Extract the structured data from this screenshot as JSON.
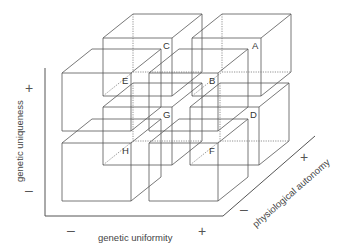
{
  "diagram": {
    "title": "",
    "cube": {
      "width": 69,
      "height": 58,
      "depth_dx": 30,
      "depth_dy": -24
    },
    "cubes": [
      {
        "label": "C",
        "x": 103,
        "y": 38,
        "layer": "back",
        "row": "top",
        "col": "left"
      },
      {
        "label": "A",
        "x": 192,
        "y": 38,
        "layer": "back",
        "row": "top",
        "col": "right"
      },
      {
        "label": "G",
        "x": 103,
        "y": 107,
        "layer": "back",
        "row": "bottom",
        "col": "left"
      },
      {
        "label": "D",
        "x": 190,
        "y": 107,
        "layer": "back",
        "row": "bottom",
        "col": "right"
      },
      {
        "label": "E",
        "x": 62,
        "y": 73,
        "layer": "front",
        "row": "top",
        "col": "left"
      },
      {
        "label": "B",
        "x": 149,
        "y": 73,
        "layer": "front",
        "row": "top",
        "col": "right"
      },
      {
        "label": "H",
        "x": 62,
        "y": 143,
        "layer": "front",
        "row": "bottom",
        "col": "left"
      },
      {
        "label": "F",
        "x": 149,
        "y": 143,
        "layer": "front",
        "row": "bottom",
        "col": "right"
      }
    ],
    "axes": {
      "vertical": {
        "label": "genetic uniqueness",
        "plus": "+",
        "minus": "–"
      },
      "horizontal": {
        "label": "genetic uniformity",
        "plus": "+",
        "minus": "–"
      },
      "depth": {
        "label": "physiological autonomy",
        "plus": "+",
        "minus": "–"
      }
    },
    "colors": {
      "line": "#555555",
      "text": "#333333",
      "background": "#ffffff"
    }
  }
}
